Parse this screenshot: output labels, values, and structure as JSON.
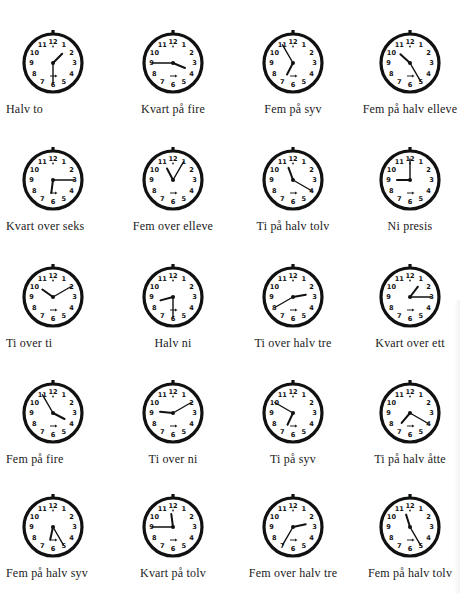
{
  "page": {
    "title": "",
    "clocks": [
      {
        "label": "Halv to",
        "hour": 1,
        "minute": 30
      },
      {
        "label": "Kvart på fire",
        "hour": 3,
        "minute": 45
      },
      {
        "label": "Fem på syv",
        "hour": 6,
        "minute": 55
      },
      {
        "label": "Fem på halv elleve",
        "hour": 10,
        "minute": 25
      },
      {
        "label": "Kvart over seks",
        "hour": 6,
        "minute": 15
      },
      {
        "label": "Fem over elleve",
        "hour": 11,
        "minute": 5
      },
      {
        "label": "Ti på halv tolv",
        "hour": 11,
        "minute": 20
      },
      {
        "label": "Ni presis",
        "hour": 9,
        "minute": 0
      },
      {
        "label": "Ti over ti",
        "hour": 10,
        "minute": 10
      },
      {
        "label": "Halv ni",
        "hour": 8,
        "minute": 30
      },
      {
        "label": "Ti over halv tre",
        "hour": 2,
        "minute": 40
      },
      {
        "label": "Kvart over ett",
        "hour": 1,
        "minute": 15
      },
      {
        "label": "Fem på fire",
        "hour": 3,
        "minute": 55
      },
      {
        "label": "Ti over ni",
        "hour": 9,
        "minute": 10
      },
      {
        "label": "Ti på syv",
        "hour": 6,
        "minute": 50
      },
      {
        "label": "Ti på halv åtte",
        "hour": 7,
        "minute": 20
      },
      {
        "label": "Fem på halv syv",
        "hour": 6,
        "minute": 25
      },
      {
        "label": "Kvart på tolv",
        "hour": 11,
        "minute": 45
      },
      {
        "label": "Fem over halv tre",
        "hour": 2,
        "minute": 35
      },
      {
        "label": "Fem på halv tolv",
        "hour": 11,
        "minute": 25
      }
    ],
    "dial_numbers": [
      "12",
      "1",
      "2",
      "3",
      "4",
      "5",
      "6",
      "7",
      "8",
      "9",
      "10",
      "11"
    ]
  }
}
